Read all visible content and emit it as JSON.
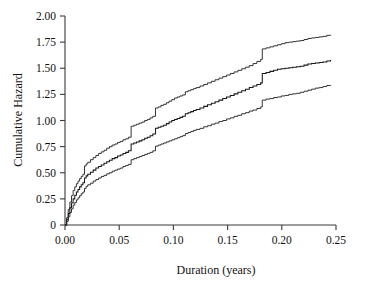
{
  "chart_data": {
    "type": "line",
    "title": "",
    "subtitle": "",
    "xlabel": "Duration (years)",
    "ylabel": "Cumulative Hazard",
    "xlim": [
      0.0,
      0.25
    ],
    "ylim": [
      0.0,
      2.0
    ],
    "xticks": [
      0.0,
      0.05,
      0.1,
      0.15,
      0.2,
      0.25
    ],
    "xtick_labels": [
      "0.00",
      "0.05",
      "0.10",
      "0.15",
      "0.20",
      "0.25"
    ],
    "yticks": [
      0.0,
      0.25,
      0.5,
      0.75,
      1.0,
      1.25,
      1.5,
      1.75,
      2.0
    ],
    "ytick_labels": [
      "0",
      "0.25",
      "0.50",
      "0.75",
      "1.00",
      "1.25",
      "1.50",
      "1.75",
      "2.00"
    ],
    "grid": false,
    "legend": null,
    "legend_position": "none",
    "step_style": "post",
    "annotations": [],
    "series": [
      {
        "name": "Upper confidence limit",
        "line_style": "step",
        "color": "#2a2a2a",
        "x": [
          0.0,
          0.0015,
          0.003,
          0.0045,
          0.006,
          0.0075,
          0.009,
          0.0105,
          0.012,
          0.0135,
          0.015,
          0.0165,
          0.018,
          0.0195,
          0.021,
          0.0235,
          0.026,
          0.0285,
          0.031,
          0.0335,
          0.036,
          0.0385,
          0.041,
          0.0435,
          0.046,
          0.0485,
          0.051,
          0.0535,
          0.056,
          0.0585,
          0.061,
          0.0635,
          0.066,
          0.0685,
          0.071,
          0.0735,
          0.076,
          0.0785,
          0.081,
          0.0835,
          0.086,
          0.0885,
          0.091,
          0.0935,
          0.096,
          0.0985,
          0.101,
          0.1035,
          0.106,
          0.1085,
          0.111,
          0.1135,
          0.116,
          0.1185,
          0.121,
          0.1245,
          0.128,
          0.1315,
          0.135,
          0.1385,
          0.142,
          0.1455,
          0.149,
          0.1525,
          0.156,
          0.1595,
          0.163,
          0.1665,
          0.17,
          0.1735,
          0.177,
          0.1805,
          0.182,
          0.1855,
          0.189,
          0.1925,
          0.196,
          0.1995,
          0.203,
          0.2065,
          0.21,
          0.2135,
          0.217,
          0.2205,
          0.224,
          0.2275,
          0.231,
          0.2345,
          0.238,
          0.2415,
          0.245
        ],
        "y": [
          0.0,
          0.07,
          0.15,
          0.22,
          0.28,
          0.33,
          0.365,
          0.395,
          0.42,
          0.445,
          0.465,
          0.485,
          0.565,
          0.585,
          0.6,
          0.625,
          0.645,
          0.665,
          0.685,
          0.7,
          0.715,
          0.735,
          0.75,
          0.765,
          0.775,
          0.79,
          0.8,
          0.815,
          0.825,
          0.84,
          0.945,
          0.955,
          0.965,
          0.975,
          0.985,
          1.0,
          1.01,
          1.025,
          1.04,
          1.12,
          1.13,
          1.145,
          1.155,
          1.17,
          1.185,
          1.2,
          1.215,
          1.225,
          1.235,
          1.245,
          1.275,
          1.285,
          1.295,
          1.305,
          1.315,
          1.33,
          1.345,
          1.36,
          1.375,
          1.39,
          1.405,
          1.42,
          1.435,
          1.45,
          1.465,
          1.48,
          1.495,
          1.51,
          1.525,
          1.545,
          1.565,
          1.585,
          1.685,
          1.695,
          1.705,
          1.715,
          1.725,
          1.735,
          1.745,
          1.75,
          1.755,
          1.76,
          1.765,
          1.775,
          1.785,
          1.79,
          1.795,
          1.8,
          1.805,
          1.815,
          1.82
        ]
      },
      {
        "name": "Estimate",
        "line_style": "step",
        "color": "#1a1a1a",
        "x": [
          0.0,
          0.0015,
          0.003,
          0.0045,
          0.006,
          0.0075,
          0.009,
          0.0105,
          0.012,
          0.0135,
          0.015,
          0.0165,
          0.018,
          0.0195,
          0.021,
          0.0235,
          0.026,
          0.0285,
          0.031,
          0.0335,
          0.036,
          0.0385,
          0.041,
          0.0435,
          0.046,
          0.0485,
          0.051,
          0.0535,
          0.056,
          0.0585,
          0.061,
          0.0635,
          0.066,
          0.0685,
          0.071,
          0.0735,
          0.076,
          0.0785,
          0.081,
          0.0835,
          0.086,
          0.0885,
          0.091,
          0.0935,
          0.096,
          0.0985,
          0.101,
          0.1035,
          0.106,
          0.1085,
          0.111,
          0.1135,
          0.116,
          0.1185,
          0.121,
          0.1245,
          0.128,
          0.1315,
          0.135,
          0.1385,
          0.142,
          0.1455,
          0.149,
          0.1525,
          0.156,
          0.1595,
          0.163,
          0.1665,
          0.17,
          0.1735,
          0.177,
          0.1805,
          0.182,
          0.1855,
          0.189,
          0.1925,
          0.196,
          0.1995,
          0.203,
          0.2065,
          0.21,
          0.2135,
          0.217,
          0.2205,
          0.224,
          0.2275,
          0.231,
          0.2345,
          0.238,
          0.2415,
          0.245
        ],
        "y": [
          0.0,
          0.05,
          0.11,
          0.165,
          0.21,
          0.25,
          0.285,
          0.315,
          0.34,
          0.365,
          0.385,
          0.405,
          0.45,
          0.47,
          0.485,
          0.505,
          0.525,
          0.545,
          0.56,
          0.575,
          0.59,
          0.605,
          0.62,
          0.635,
          0.645,
          0.66,
          0.67,
          0.685,
          0.695,
          0.71,
          0.775,
          0.785,
          0.795,
          0.805,
          0.815,
          0.83,
          0.84,
          0.855,
          0.87,
          0.925,
          0.935,
          0.945,
          0.955,
          0.97,
          0.985,
          1.0,
          1.01,
          1.02,
          1.03,
          1.04,
          1.065,
          1.075,
          1.085,
          1.095,
          1.105,
          1.12,
          1.135,
          1.15,
          1.165,
          1.18,
          1.195,
          1.21,
          1.225,
          1.24,
          1.255,
          1.27,
          1.285,
          1.3,
          1.315,
          1.33,
          1.345,
          1.36,
          1.45,
          1.46,
          1.47,
          1.48,
          1.49,
          1.495,
          1.5,
          1.505,
          1.51,
          1.515,
          1.52,
          1.53,
          1.54,
          1.545,
          1.55,
          1.555,
          1.56,
          1.57,
          1.58
        ]
      },
      {
        "name": "Lower confidence limit",
        "line_style": "step",
        "color": "#2a2a2a",
        "x": [
          0.0,
          0.0015,
          0.003,
          0.0045,
          0.006,
          0.0075,
          0.009,
          0.0105,
          0.012,
          0.0135,
          0.015,
          0.0165,
          0.018,
          0.0195,
          0.021,
          0.0235,
          0.026,
          0.0285,
          0.031,
          0.0335,
          0.036,
          0.0385,
          0.041,
          0.0435,
          0.046,
          0.0485,
          0.051,
          0.0535,
          0.056,
          0.0585,
          0.061,
          0.0635,
          0.066,
          0.0685,
          0.071,
          0.0735,
          0.076,
          0.0785,
          0.081,
          0.0835,
          0.086,
          0.0885,
          0.091,
          0.0935,
          0.096,
          0.0985,
          0.101,
          0.1035,
          0.106,
          0.1085,
          0.111,
          0.1135,
          0.116,
          0.1185,
          0.121,
          0.1245,
          0.128,
          0.1315,
          0.135,
          0.1385,
          0.142,
          0.1455,
          0.149,
          0.1525,
          0.156,
          0.1595,
          0.163,
          0.1665,
          0.17,
          0.1735,
          0.177,
          0.1805,
          0.182,
          0.1855,
          0.189,
          0.1925,
          0.196,
          0.1995,
          0.203,
          0.2065,
          0.21,
          0.2135,
          0.217,
          0.2205,
          0.224,
          0.2275,
          0.231,
          0.2345,
          0.238,
          0.2415,
          0.245
        ],
        "y": [
          0.0,
          0.035,
          0.08,
          0.12,
          0.155,
          0.19,
          0.215,
          0.24,
          0.26,
          0.28,
          0.3,
          0.315,
          0.35,
          0.37,
          0.385,
          0.4,
          0.42,
          0.435,
          0.45,
          0.465,
          0.475,
          0.49,
          0.5,
          0.515,
          0.525,
          0.535,
          0.545,
          0.56,
          0.57,
          0.58,
          0.625,
          0.635,
          0.645,
          0.655,
          0.665,
          0.675,
          0.685,
          0.695,
          0.71,
          0.755,
          0.765,
          0.775,
          0.785,
          0.795,
          0.805,
          0.815,
          0.825,
          0.835,
          0.845,
          0.855,
          0.875,
          0.885,
          0.895,
          0.905,
          0.915,
          0.925,
          0.94,
          0.95,
          0.965,
          0.975,
          0.99,
          1.0,
          1.015,
          1.025,
          1.04,
          1.05,
          1.065,
          1.075,
          1.09,
          1.1,
          1.115,
          1.13,
          1.195,
          1.205,
          1.21,
          1.22,
          1.225,
          1.235,
          1.24,
          1.25,
          1.255,
          1.26,
          1.27,
          1.28,
          1.29,
          1.3,
          1.31,
          1.315,
          1.325,
          1.335,
          1.34
        ]
      }
    ]
  },
  "axes": {
    "x_title": "Duration (years)",
    "y_title": "Cumulative Hazard"
  }
}
